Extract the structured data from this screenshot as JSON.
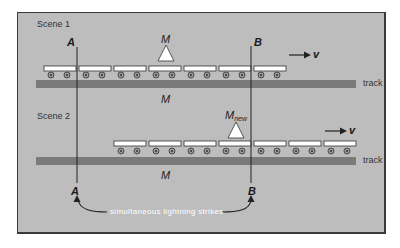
{
  "scene1": {
    "label": "Scene 1",
    "mass_label": "M",
    "track_mass_label": "M",
    "track_label": "track",
    "velocity_label": "v",
    "car_count": 7,
    "car_start_x": 44
  },
  "scene2": {
    "label": "Scene 2",
    "mass_label": "M",
    "mass_subscript": "new",
    "track_mass_label": "M",
    "track_label": "track",
    "velocity_label": "v",
    "car_count": 7,
    "car_start_x": 114
  },
  "points": {
    "a_top": "A",
    "b_top": "B",
    "a_bottom": "A",
    "b_bottom": "B"
  },
  "caption": "simultaneous lightning strikes",
  "colors": {
    "background": "#bdbdbd",
    "track": "#7a7a7a",
    "car_fill": "#ffffff",
    "wheel": "#6a6a6a",
    "line": "#222222",
    "caption_text": "#ffffff"
  }
}
